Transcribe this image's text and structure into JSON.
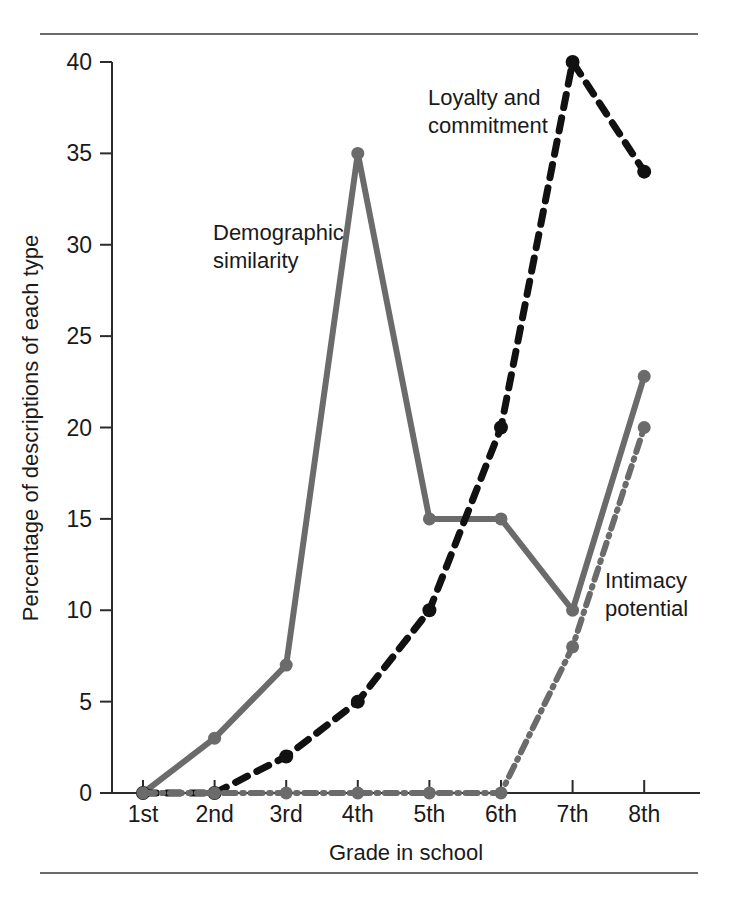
{
  "figure": {
    "rules": {
      "top": "horizontal-rule",
      "bottom": "horizontal-rule"
    }
  },
  "chart_data": {
    "type": "line",
    "title": "",
    "xlabel": "Grade in school",
    "ylabel": "Percentage of descriptions of each type",
    "categories": [
      "1st",
      "2nd",
      "3rd",
      "4th",
      "5th",
      "6th",
      "7th",
      "8th"
    ],
    "xticklabels": [
      "1st",
      "2nd",
      "3rd",
      "4th",
      "5th",
      "6th",
      "7th",
      "8th"
    ],
    "yticklabels": [
      "0",
      "5",
      "10",
      "15",
      "20",
      "25",
      "30",
      "35",
      "40"
    ],
    "yticks": [
      0,
      5,
      10,
      15,
      20,
      25,
      30,
      35,
      40
    ],
    "ylim": [
      0,
      40
    ],
    "grid": false,
    "legend": "inline-annotations",
    "series": [
      {
        "name": "Demographic similarity",
        "label": "Demographic\nsimilarity",
        "label_line1": "Demographic",
        "label_line2": "similarity",
        "color": "#6b6b6b",
        "style": "solid",
        "values": [
          0,
          3,
          7,
          35,
          15,
          15,
          10,
          22.8
        ]
      },
      {
        "name": "Loyalty and commitment",
        "label": "Loyalty and\ncommitment",
        "label_line1": "Loyalty and",
        "label_line2": "commitment",
        "color": "#111111",
        "style": "dashed",
        "values": [
          0,
          0,
          2,
          5,
          10,
          20,
          40,
          34
        ]
      },
      {
        "name": "Intimacy potential",
        "label": "Intimacy\npotential",
        "label_line1": "Intimacy",
        "label_line2": "potential",
        "color": "#6b6b6b",
        "style": "dashdot",
        "values": [
          0,
          0,
          0,
          0,
          0,
          0,
          8,
          20
        ]
      }
    ]
  }
}
